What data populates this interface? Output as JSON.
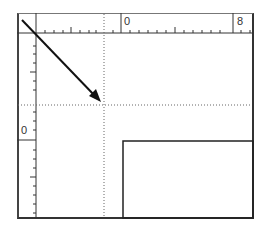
{
  "ruler": {
    "horizontal": {
      "origin_label": "0",
      "end_label": "8"
    },
    "vertical": {
      "origin_label": "0"
    }
  },
  "canvas": {
    "guide_lines": [
      {
        "orientation": "vertical",
        "position": 104
      },
      {
        "orientation": "horizontal",
        "position": 105
      }
    ],
    "arrow": {
      "from": [
        22,
        20
      ],
      "to": [
        100,
        101
      ]
    },
    "rectangle": {
      "x": 123,
      "y": 141,
      "width": 130,
      "height": 77
    }
  },
  "colors": {
    "line": "#222222",
    "guide": "#666666",
    "ruler_text": "#333333"
  }
}
